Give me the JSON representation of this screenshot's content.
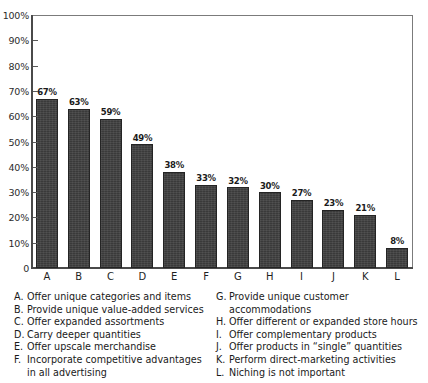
{
  "chart_data": {
    "type": "bar",
    "title": "",
    "subtitle": "",
    "xlabel": "",
    "ylabel": "",
    "categories": [
      "A",
      "B",
      "C",
      "D",
      "E",
      "F",
      "G",
      "H",
      "I",
      "J",
      "K",
      "L"
    ],
    "values": [
      67,
      63,
      59,
      49,
      38,
      33,
      32,
      30,
      27,
      23,
      21,
      8
    ],
    "value_labels": [
      "67%",
      "63%",
      "59%",
      "49%",
      "38%",
      "33%",
      "32%",
      "30%",
      "27%",
      "23%",
      "21%",
      "8%"
    ],
    "ylim": [
      0,
      100
    ],
    "y_ticks": [
      0,
      10,
      20,
      30,
      40,
      50,
      60,
      70,
      80,
      90,
      100
    ],
    "y_tick_labels": [
      "0",
      "10%",
      "20%",
      "30%",
      "40%",
      "50%",
      "60%",
      "70%",
      "80%",
      "90%",
      "100%"
    ],
    "grid": false,
    "legend_position": "below-chart",
    "bar_color": "#3a3a3a",
    "axis_color": "#4a4a4a",
    "frame_color": "#7b7b7b",
    "background_color": "#ffffff"
  },
  "legend": {
    "left_column": [
      {
        "key": "A.",
        "text": "Offer unique categories and items"
      },
      {
        "key": "B.",
        "text": "Provide unique value-added services"
      },
      {
        "key": "C.",
        "text": "Offer expanded assortments"
      },
      {
        "key": "D.",
        "text": "Carry deeper quantities"
      },
      {
        "key": "E.",
        "text": "Offer upscale merchandise"
      },
      {
        "key": "F.",
        "text": "Incorporate competitive advantages"
      }
    ],
    "left_continuation": "in all advertising",
    "right_column": [
      {
        "key": "G.",
        "text": "Provide unique customer accommodations"
      },
      {
        "key": "H.",
        "text": "Offer different or expanded store hours"
      },
      {
        "key": "I.",
        "text": "Offer complementary products"
      },
      {
        "key": "J.",
        "text": "Offer products in “single” quantities"
      },
      {
        "key": "K.",
        "text": "Perform direct-marketing activities"
      },
      {
        "key": "L.",
        "text": "Niching is not important"
      }
    ]
  }
}
